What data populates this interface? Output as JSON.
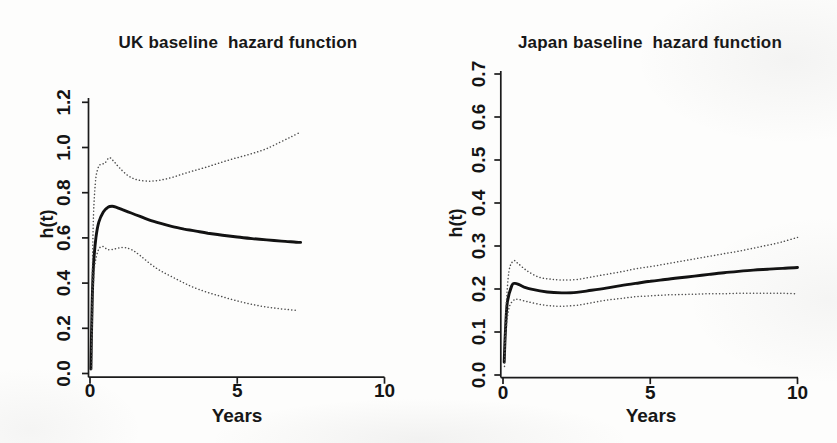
{
  "chart_data": [
    {
      "type": "line",
      "title": "UK baseline  hazard function",
      "xlabel": "Years",
      "ylabel": "h(t)",
      "xlim": [
        0,
        10
      ],
      "ylim": [
        0,
        1.2
      ],
      "xticks": [
        "0",
        "5",
        "10"
      ],
      "yticks": [
        "0.0",
        "0.2",
        "0.4",
        "0.6",
        "0.8",
        "1.0",
        "1.2"
      ],
      "grid": false,
      "legend": "none",
      "frame": "left-bottom-axes-only",
      "series": [
        {
          "name": "baseline hazard estimate",
          "style": "solid",
          "x": [
            0.03,
            0.07,
            0.12,
            0.2,
            0.3,
            0.45,
            0.6,
            0.75,
            0.9,
            1.1,
            1.4,
            1.7,
            2.0,
            2.4,
            2.8,
            3.2,
            3.6,
            4.0,
            4.5,
            5.0,
            5.5,
            6.0,
            6.5,
            7.0,
            7.15
          ],
          "y": [
            0.02,
            0.3,
            0.48,
            0.6,
            0.67,
            0.715,
            0.735,
            0.74,
            0.735,
            0.725,
            0.71,
            0.695,
            0.68,
            0.664,
            0.65,
            0.639,
            0.63,
            0.621,
            0.612,
            0.604,
            0.597,
            0.591,
            0.586,
            0.581,
            0.58
          ]
        },
        {
          "name": "upper confidence band",
          "style": "dotted",
          "x": [
            0.05,
            0.08,
            0.12,
            0.18,
            0.25,
            0.35,
            0.5,
            0.65,
            0.8,
            1.0,
            1.3,
            1.6,
            2.0,
            2.4,
            2.8,
            3.2,
            3.6,
            4.0,
            4.4,
            4.8,
            5.2,
            5.6,
            6.0,
            6.4,
            6.8,
            7.1
          ],
          "y": [
            0.1,
            0.45,
            0.7,
            0.84,
            0.9,
            0.925,
            0.93,
            0.955,
            0.94,
            0.91,
            0.875,
            0.857,
            0.851,
            0.856,
            0.868,
            0.885,
            0.9,
            0.915,
            0.932,
            0.948,
            0.962,
            0.977,
            0.995,
            1.02,
            1.045,
            1.065
          ]
        },
        {
          "name": "lower confidence band",
          "style": "dotted",
          "x": [
            0.05,
            0.09,
            0.14,
            0.22,
            0.32,
            0.45,
            0.6,
            0.8,
            1.0,
            1.2,
            1.45,
            1.7,
            2.0,
            2.3,
            2.6,
            2.9,
            3.2,
            3.5,
            3.9,
            4.3,
            4.7,
            5.1,
            5.5,
            5.9,
            6.3,
            6.7,
            7.0
          ],
          "y": [
            0.02,
            0.3,
            0.45,
            0.52,
            0.555,
            0.562,
            0.548,
            0.55,
            0.556,
            0.557,
            0.545,
            0.522,
            0.49,
            0.462,
            0.44,
            0.42,
            0.4,
            0.382,
            0.363,
            0.347,
            0.332,
            0.318,
            0.306,
            0.296,
            0.289,
            0.283,
            0.28
          ]
        }
      ]
    },
    {
      "type": "line",
      "title": "Japan baseline  hazard function",
      "xlabel": "Years",
      "ylabel": "h(t)",
      "xlim": [
        0,
        10
      ],
      "ylim": [
        0,
        0.7
      ],
      "xticks": [
        "0",
        "5",
        "10"
      ],
      "yticks": [
        "0.0",
        "0.1",
        "0.2",
        "0.3",
        "0.4",
        "0.5",
        "0.6",
        "0.7"
      ],
      "grid": false,
      "legend": "none",
      "frame": "left-bottom-axes-only",
      "series": [
        {
          "name": "baseline hazard estimate",
          "style": "solid",
          "x": [
            0.04,
            0.08,
            0.15,
            0.3,
            0.4,
            0.55,
            0.7,
            1.0,
            1.5,
            2.0,
            2.5,
            3.0,
            3.5,
            4.0,
            4.5,
            5.0,
            5.5,
            6.0,
            6.5,
            7.0,
            7.5,
            8.0,
            8.5,
            9.0,
            9.5,
            10
          ],
          "y": [
            0.03,
            0.1,
            0.17,
            0.208,
            0.213,
            0.21,
            0.205,
            0.199,
            0.193,
            0.191,
            0.192,
            0.197,
            0.202,
            0.208,
            0.213,
            0.218,
            0.222,
            0.226,
            0.23,
            0.234,
            0.238,
            0.241,
            0.244,
            0.246,
            0.248,
            0.25
          ]
        },
        {
          "name": "upper confidence band",
          "style": "dotted",
          "x": [
            0.05,
            0.1,
            0.2,
            0.35,
            0.5,
            0.8,
            1.2,
            1.6,
            2.0,
            2.5,
            3.0,
            3.5,
            4.0,
            4.5,
            5.0,
            5.5,
            6.0,
            6.5,
            7.0,
            7.5,
            8.0,
            8.5,
            9.0,
            9.5,
            10
          ],
          "y": [
            0.05,
            0.15,
            0.24,
            0.265,
            0.26,
            0.243,
            0.228,
            0.223,
            0.221,
            0.222,
            0.228,
            0.234,
            0.24,
            0.247,
            0.252,
            0.258,
            0.264,
            0.27,
            0.276,
            0.282,
            0.288,
            0.295,
            0.302,
            0.31,
            0.32
          ]
        },
        {
          "name": "lower confidence band",
          "style": "dotted",
          "x": [
            0.05,
            0.1,
            0.2,
            0.35,
            0.5,
            0.8,
            1.2,
            1.6,
            2.0,
            2.5,
            3.0,
            3.5,
            4.0,
            4.5,
            5.0,
            5.5,
            6.0,
            6.5,
            7.0,
            7.5,
            8.0,
            8.5,
            9.0,
            9.5,
            10
          ],
          "y": [
            0.02,
            0.1,
            0.155,
            0.173,
            0.176,
            0.171,
            0.165,
            0.161,
            0.16,
            0.162,
            0.168,
            0.174,
            0.178,
            0.182,
            0.184,
            0.186,
            0.187,
            0.188,
            0.189,
            0.189,
            0.19,
            0.19,
            0.19,
            0.19,
            0.189
          ]
        }
      ]
    }
  ]
}
